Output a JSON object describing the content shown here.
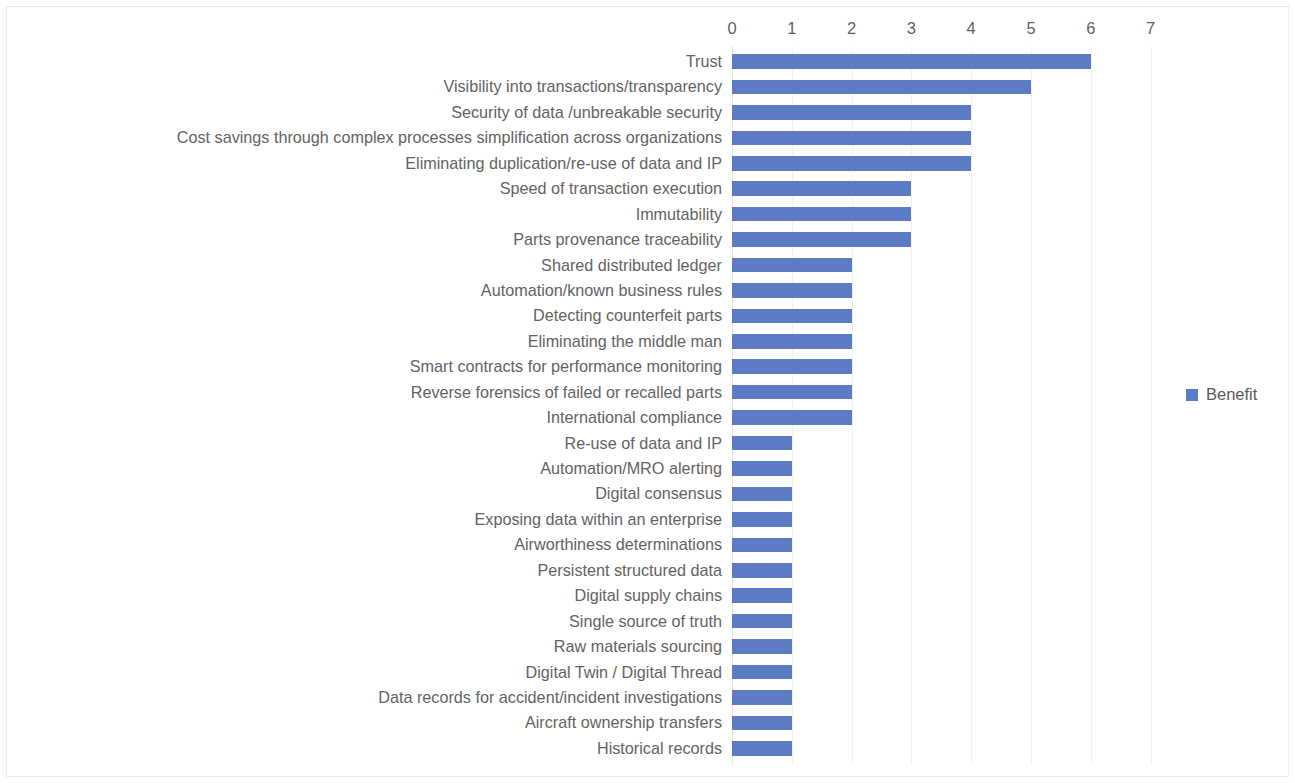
{
  "chart_data": {
    "type": "bar",
    "orientation": "horizontal",
    "title": "",
    "subtitle": "",
    "xlabel": "",
    "ylabel": "",
    "xlim": [
      0,
      7
    ],
    "xticks": [
      "0",
      "1",
      "2",
      "3",
      "4",
      "5",
      "6",
      "7"
    ],
    "grid": true,
    "legend": {
      "position": "right",
      "entries": [
        {
          "label": "Benefit",
          "color": "#5b7cc4"
        }
      ]
    },
    "series": [
      {
        "name": "Benefit",
        "color": "#5b7cc4",
        "values": [
          6,
          5,
          4,
          4,
          4,
          3,
          3,
          3,
          2,
          2,
          2,
          2,
          2,
          2,
          2,
          1,
          1,
          1,
          1,
          1,
          1,
          1,
          1,
          1,
          1,
          1,
          1,
          1
        ]
      }
    ],
    "categories": [
      "Trust",
      "Visibility into transactions/transparency",
      "Security of data /unbreakable security",
      "Cost savings through complex processes simplification across organizations",
      "Eliminating duplication/re-use of data and IP",
      "Speed of transaction execution",
      "Immutability",
      "Parts provenance traceability",
      "Shared distributed ledger",
      "Automation/known business rules",
      "Detecting counterfeit parts",
      "Eliminating the middle man",
      "Smart contracts for performance monitoring",
      "Reverse forensics of failed or recalled parts",
      "International compliance",
      "Re-use of data and IP",
      "Automation/MRO alerting",
      "Digital consensus",
      "Exposing data within an enterprise",
      "Airworthiness determinations",
      "Persistent structured data",
      "Digital supply chains",
      "Single source of truth",
      "Raw materials sourcing",
      "Digital Twin / Digital Thread",
      "Data records for accident/incident investigations",
      "Aircraft ownership transfers",
      "Historical records"
    ],
    "colors": {
      "bar": "#5b7cc4",
      "label_text": "#636363",
      "tick_text": "#5f5f5f",
      "gridline": "#f2f2f4",
      "axis": "#e3e3e8",
      "background": "#ffffff",
      "frame": "#ececec"
    }
  }
}
